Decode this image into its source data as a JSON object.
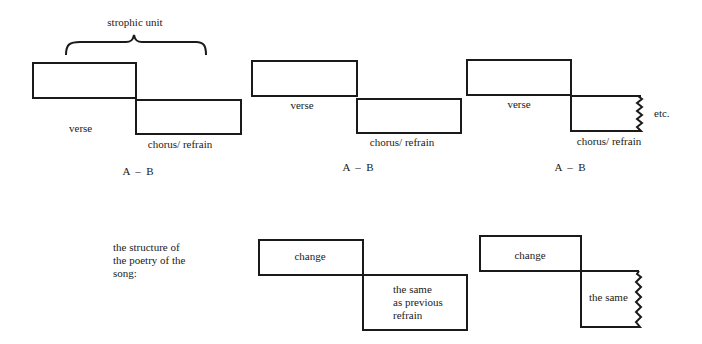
{
  "diagram": {
    "brace_label": "strophic unit",
    "rows": [
      {
        "units": [
          {
            "top_label": "verse",
            "bottom_label": "chorus/ refrain",
            "formula": "A  –  B"
          },
          {
            "top_label": "verse",
            "bottom_label": "chorus/ refrain",
            "formula": "A  –  B"
          },
          {
            "top_label": "verse",
            "bottom_label": "chorus/ refrain",
            "formula": "A  –  B",
            "continuation": "etc."
          }
        ]
      }
    ],
    "poetry": {
      "caption": "the structure of the poetry of the song:",
      "caption_lines": [
        "the structure of",
        "the poetry of the",
        "song:"
      ],
      "units": [
        {
          "top_label": "change",
          "bottom_label_lines": [
            "the same",
            "as previous",
            "refrain"
          ]
        },
        {
          "top_label": "change",
          "bottom_label": "the same"
        }
      ]
    },
    "colors": {
      "stroke": "#1a1a1a",
      "background": "#ffffff"
    }
  }
}
